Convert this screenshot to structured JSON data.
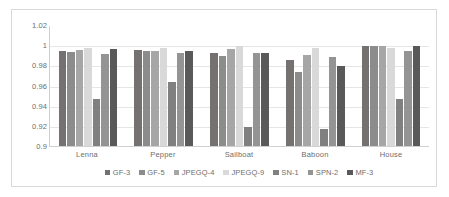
{
  "chart_data": {
    "type": "bar",
    "title": "",
    "subtitle": "",
    "xlabel": "",
    "ylabel": "",
    "ylim": [
      0.9,
      1.02
    ],
    "yticks": [
      "1.02",
      "1",
      "0.98",
      "0.96",
      "0.94",
      "0.92",
      "0.9"
    ],
    "ytick_values": [
      1.02,
      1.0,
      0.98,
      0.96,
      0.94,
      0.92,
      0.9
    ],
    "grid": true,
    "legend_position": "bottom",
    "categories": [
      "Lenna",
      "Pepper",
      "Sailboat",
      "Baboon",
      "House"
    ],
    "series": [
      {
        "name": "GF-3",
        "color": "#767171",
        "values": [
          0.9945,
          0.9948,
          0.9922,
          0.9855,
          0.9988
        ]
      },
      {
        "name": "GF-5",
        "color": "#8C8C8C",
        "values": [
          0.9928,
          0.9938,
          0.9893,
          0.9738,
          0.999
        ]
      },
      {
        "name": "JPEGQ-4",
        "color": "#A6A6A6",
        "values": [
          0.9948,
          0.9938,
          0.9958,
          0.99,
          0.9988
        ]
      },
      {
        "name": "JPEGQ-9",
        "color": "#D9D9D9",
        "values": [
          0.9975,
          0.9972,
          0.9988,
          0.9975,
          0.9975
        ]
      },
      {
        "name": "SN-1",
        "color": "#808080",
        "values": [
          0.9462,
          0.9632,
          0.9188,
          0.9172,
          0.9468
        ]
      },
      {
        "name": "SPN-2",
        "color": "#949494",
        "values": [
          0.9908,
          0.9918,
          0.9922,
          0.9882,
          0.9938
        ]
      },
      {
        "name": "MF-3",
        "color": "#595959",
        "values": [
          0.9962,
          0.9942,
          0.9922,
          0.9793,
          0.999
        ]
      }
    ]
  },
  "legend": {
    "items": [
      {
        "label": "GF-3",
        "color": "#767171"
      },
      {
        "label": "GF-5",
        "color": "#8C8C8C"
      },
      {
        "label": "JPEGQ-4",
        "color": "#A6A6A6"
      },
      {
        "label": "JPEGQ-9",
        "color": "#D9D9D9"
      },
      {
        "label": "SN-1",
        "color": "#808080"
      },
      {
        "label": "SPN-2",
        "color": "#949494"
      },
      {
        "label": "MF-3",
        "color": "#595959"
      }
    ]
  }
}
